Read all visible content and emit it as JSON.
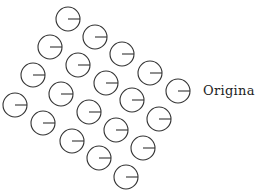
{
  "diagram": {
    "label": "Origina",
    "circle_radius": 12,
    "stroke_color": "#333333",
    "stroke_width": 1.1,
    "indicator": "horizontal line from center to right edge (angle 0)",
    "circles": [
      {
        "cx": 68,
        "cy": 19,
        "angle": 0
      },
      {
        "cx": 95,
        "cy": 37,
        "angle": 0
      },
      {
        "cx": 122,
        "cy": 54,
        "angle": 0
      },
      {
        "cx": 150,
        "cy": 73,
        "angle": 0
      },
      {
        "cx": 178,
        "cy": 91,
        "angle": 0
      },
      {
        "cx": 50,
        "cy": 47,
        "angle": 0
      },
      {
        "cx": 78,
        "cy": 65,
        "angle": 0
      },
      {
        "cx": 106,
        "cy": 83,
        "angle": 0
      },
      {
        "cx": 132,
        "cy": 100,
        "angle": 0
      },
      {
        "cx": 159,
        "cy": 119,
        "angle": 0
      },
      {
        "cx": 33,
        "cy": 75,
        "angle": 0
      },
      {
        "cx": 61,
        "cy": 94,
        "angle": 0
      },
      {
        "cx": 89,
        "cy": 112,
        "angle": 0
      },
      {
        "cx": 116,
        "cy": 130,
        "angle": 0
      },
      {
        "cx": 143,
        "cy": 148,
        "angle": 0
      },
      {
        "cx": 15,
        "cy": 105,
        "angle": 0
      },
      {
        "cx": 43,
        "cy": 123,
        "angle": 0
      },
      {
        "cx": 72,
        "cy": 141,
        "angle": 0
      },
      {
        "cx": 99,
        "cy": 158,
        "angle": 0
      },
      {
        "cx": 126,
        "cy": 177,
        "angle": 0
      }
    ]
  }
}
